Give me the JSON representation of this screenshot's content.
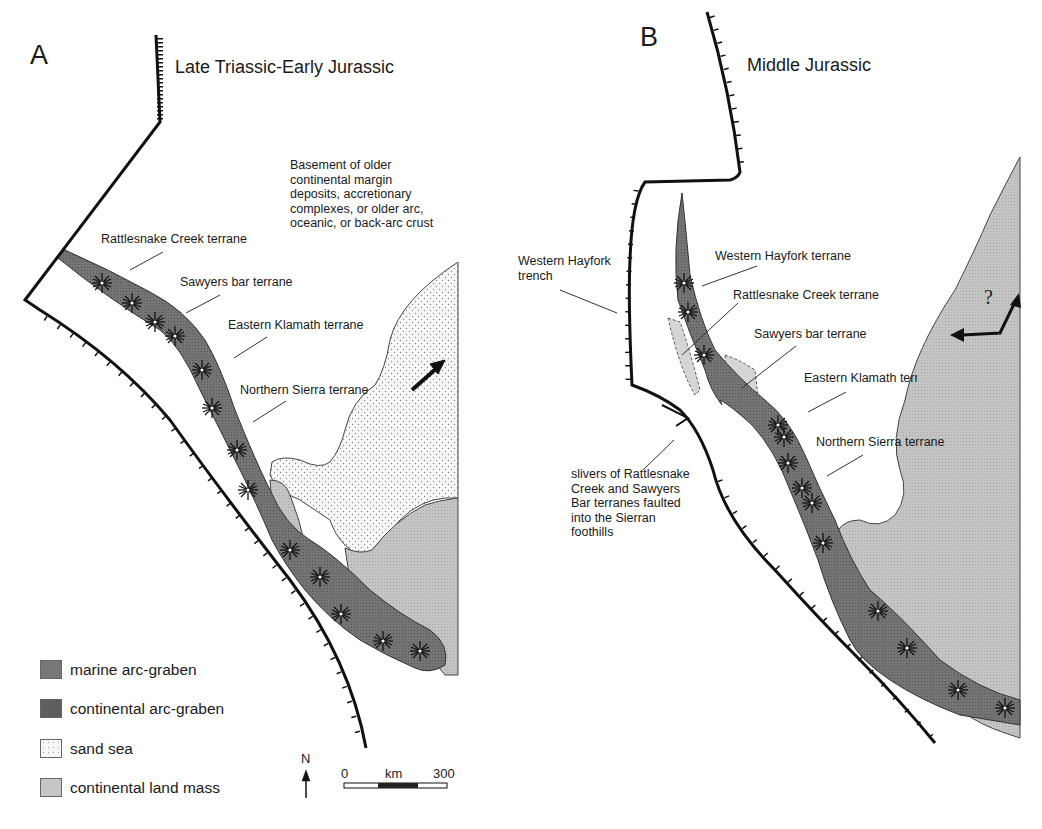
{
  "panels": [
    {
      "letter": "A",
      "title": "Late Triassic-Early Jurassic",
      "labels": [
        "Rattlesnake Creek terrane",
        "Sawyers bar terrane",
        "Eastern Klamath terrane",
        "Northern Sierra terrane"
      ],
      "note": "Basement of older continental margin deposits, accretionary complexes, or older arc, oceanic, or back-arc crust"
    },
    {
      "letter": "B",
      "title": "Middle Jurassic",
      "labels": [
        "Western Hayfork terrane",
        "Rattlesnake Creek terrane",
        "Sawyers bar terrane",
        "Eastern Klamath terrane",
        "Northern Sierra terrane"
      ],
      "trench_label": "Western Hayfork trench",
      "slivers_note": "slivers of Rattlesnake Creek and Sawyers Bar terranes faulted into the Sierran foothills",
      "question_mark": "?"
    }
  ],
  "legend": [
    {
      "label": "marine arc-graben",
      "color": "#6e6e6e"
    },
    {
      "label": "continental arc-graben",
      "color": "#5a5a5a"
    },
    {
      "label": "sand sea",
      "color": "#f4f4f4"
    },
    {
      "label": "continental land mass",
      "color": "#bdbdbd"
    }
  ],
  "north_arrow": {
    "label": "N"
  },
  "scale_bar": {
    "start": "0",
    "unit": "km",
    "end": "300"
  }
}
